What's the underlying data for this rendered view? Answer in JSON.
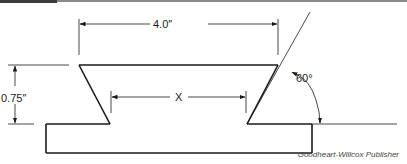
{
  "diagram": {
    "type": "dovetail-slide cross-section",
    "dimensions": {
      "top_width": "4.0″",
      "height": "0.75″",
      "unknown": "X",
      "angle": "60°"
    },
    "credit": "Goodheart-Willcox Publisher"
  },
  "colors": {
    "line": "#1a1a1a",
    "background": "#ffffff",
    "topbar": "#8a8a8a"
  }
}
